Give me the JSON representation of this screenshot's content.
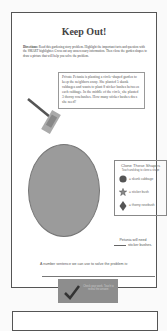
{
  "worksheet": {
    "title": "Keep Out!",
    "directions_label": "Directions:",
    "directions_text": "Read this gardening story problem. Highlight the important facts and question with the SMART highlighter. Cross out any unnecessary information. Then clone the garden shapes to draw a picture that will help you solve the problem.",
    "story": "Private Petunia is planting a circle-shaped garden to keep the neighbors away. She planted 5 skunk cabbages and wants to plant 8 sticker bushes between each cabbage. In the middle of the circle, she planted 3 thorny rosebushes. How many sticker bushes does she need?",
    "shapes_box": {
      "title": "Clone These Shapes",
      "subtitle": "Touch and drag to clone a shape",
      "items": [
        {
          "icon": "circle-icon",
          "label": "= skunk cabbage"
        },
        {
          "icon": "star-icon",
          "label": "= sticker bush"
        },
        {
          "icon": "diamond-icon",
          "label": "= thorny rosebush"
        }
      ]
    },
    "answer_line1": "Petunia will need",
    "answer_line2": "sticker bushes.",
    "sentence_prompt": "A number sentence we can use to solve the problem is:",
    "check_button": {
      "icon": "checkmark-icon",
      "label": "Check your work. Touch to reveal the answer."
    }
  },
  "colors": {
    "circle_fill": "#9b9b9b",
    "check_bg": "#8d8d8d",
    "border": "#555555"
  }
}
